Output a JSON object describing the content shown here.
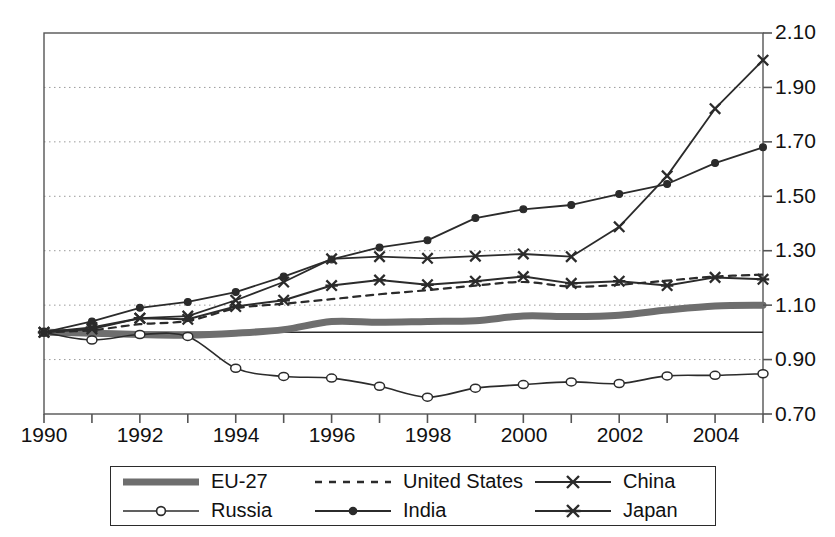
{
  "chart_data": {
    "type": "line",
    "title": "",
    "subtitle": "",
    "xlabel": "",
    "ylabel": "",
    "x": [
      1990,
      1991,
      1992,
      1993,
      1994,
      1995,
      1996,
      1997,
      1998,
      1999,
      2000,
      2001,
      2002,
      2003,
      2004,
      2005
    ],
    "xlim": [
      1990,
      2005
    ],
    "ylim": [
      0.7,
      2.1
    ],
    "y_ticks": [
      0.7,
      0.9,
      1.1,
      1.3,
      1.5,
      1.7,
      1.9,
      2.1
    ],
    "y_tick_labels": [
      "0.70",
      "0.90",
      "1.10",
      "1.30",
      "1.50",
      "1.70",
      "1.90",
      "2.10"
    ],
    "x_ticks": [
      1990,
      1991,
      1992,
      1993,
      1994,
      1995,
      1996,
      1997,
      1998,
      1999,
      2000,
      2001,
      2002,
      2003,
      2004,
      2005
    ],
    "x_tick_labels_shown": [
      "1990",
      "1992",
      "1994",
      "1996",
      "1998",
      "2000",
      "2002",
      "2004"
    ],
    "x_tick_label_years": [
      1990,
      1992,
      1994,
      1996,
      1998,
      2000,
      2002,
      2004
    ],
    "grid": "horizontal-dotted",
    "reference_line_y": 1.0,
    "legend_position": "bottom",
    "series": [
      {
        "name": "EU-27",
        "marker": "none",
        "style": "thick-solid",
        "color": "#6e6e6e",
        "width": 7,
        "values": [
          1.0,
          0.997,
          0.992,
          0.99,
          0.997,
          1.01,
          1.04,
          1.037,
          1.04,
          1.043,
          1.06,
          1.058,
          1.063,
          1.082,
          1.097,
          1.1
        ]
      },
      {
        "name": "United States",
        "marker": "none",
        "style": "dashed",
        "color": "#2b2b2b",
        "width": 2.2,
        "values": [
          1.0,
          1.008,
          1.03,
          1.042,
          1.088,
          1.105,
          1.122,
          1.14,
          1.155,
          1.172,
          1.185,
          1.168,
          1.175,
          1.19,
          1.205,
          1.212
        ]
      },
      {
        "name": "China",
        "marker": "x",
        "style": "solid",
        "color": "#2b2b2b",
        "width": 1.8,
        "values": [
          1.0,
          1.012,
          1.052,
          1.06,
          1.118,
          1.185,
          1.27,
          1.278,
          1.272,
          1.28,
          1.288,
          1.278,
          1.388,
          1.575,
          1.822,
          2.0
        ]
      },
      {
        "name": "Russia",
        "marker": "circle",
        "style": "solid",
        "color": "#2b2b2b",
        "width": 1.6,
        "values": [
          1.0,
          0.972,
          0.992,
          0.985,
          0.868,
          0.838,
          0.832,
          0.802,
          0.762,
          0.795,
          0.808,
          0.818,
          0.812,
          0.84,
          0.842,
          0.848
        ]
      },
      {
        "name": "India",
        "marker": "dot",
        "style": "solid",
        "color": "#2b2b2b",
        "width": 1.8,
        "values": [
          1.0,
          1.04,
          1.09,
          1.112,
          1.148,
          1.205,
          1.268,
          1.312,
          1.338,
          1.42,
          1.452,
          1.468,
          1.508,
          1.545,
          1.622,
          1.68
        ]
      },
      {
        "name": "Japan",
        "marker": "asterisk",
        "style": "solid",
        "color": "#2b2b2b",
        "width": 2.0,
        "values": [
          1.0,
          1.018,
          1.052,
          1.048,
          1.095,
          1.118,
          1.172,
          1.192,
          1.175,
          1.188,
          1.205,
          1.18,
          1.188,
          1.172,
          1.202,
          1.195
        ]
      }
    ]
  },
  "legend": {
    "items": [
      {
        "label": "EU-27",
        "sample": "thick-gray-line",
        "icon": "line-sample-icon"
      },
      {
        "label": "United States",
        "sample": "dashed-line",
        "icon": "line-sample-icon"
      },
      {
        "label": "China",
        "sample": "line-with-x-marker",
        "icon": "line-sample-icon"
      },
      {
        "label": "Russia",
        "sample": "line-with-circle-marker",
        "icon": "line-sample-icon"
      },
      {
        "label": "India",
        "sample": "line-with-dot-marker",
        "icon": "line-sample-icon"
      },
      {
        "label": "Japan",
        "sample": "line-with-asterisk-marker",
        "icon": "line-sample-icon"
      }
    ]
  },
  "axes": {
    "y_labels": [
      "2.10",
      "1.90",
      "1.70",
      "1.50",
      "1.30",
      "1.10",
      "0.90",
      "0.70"
    ],
    "x_labels": [
      "1990",
      "1992",
      "1994",
      "1996",
      "1998",
      "2000",
      "2002",
      "2004"
    ]
  },
  "colors": {
    "axis": "#555555",
    "grid": "#9a9a9a",
    "series_dark": "#2b2b2b",
    "eu_gray": "#6e6e6e",
    "background": "#ffffff"
  }
}
